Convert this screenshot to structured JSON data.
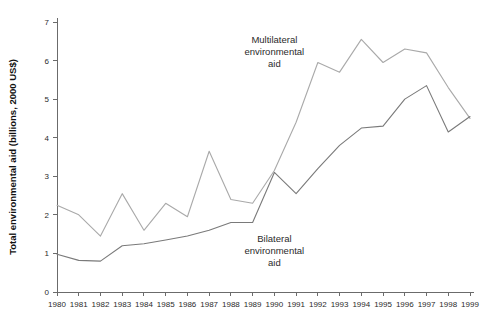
{
  "chart_data": {
    "type": "line",
    "title": "",
    "xlabel": "",
    "ylabel": "Total environmental aid (billions, 2000 US$)",
    "categories": [
      "1980",
      "1981",
      "1982",
      "1983",
      "1984",
      "1985",
      "1986",
      "1987",
      "1988",
      "1989",
      "1990",
      "1991",
      "1992",
      "1993",
      "1994",
      "1995",
      "1996",
      "1997",
      "1998",
      "1999"
    ],
    "x": [
      1980,
      1981,
      1982,
      1983,
      1984,
      1985,
      1986,
      1987,
      1988,
      1989,
      1990,
      1991,
      1992,
      1993,
      1994,
      1995,
      1996,
      1997,
      1998,
      1999
    ],
    "xlim": [
      1980,
      1999
    ],
    "ylim": [
      0,
      7
    ],
    "yticks": [
      0,
      1,
      2,
      3,
      4,
      5,
      6,
      7
    ],
    "grid": false,
    "legend": "annotations-inline",
    "series": [
      {
        "name": "Multilateral environmental aid",
        "color": "#a9a9a9",
        "values": [
          2.25,
          2.0,
          1.45,
          2.55,
          1.6,
          2.3,
          1.95,
          3.65,
          2.4,
          2.3,
          3.15,
          4.4,
          5.95,
          5.7,
          6.55,
          5.95,
          6.3,
          6.2,
          5.3,
          4.5
        ]
      },
      {
        "name": "Bilateral environmental aid",
        "color": "#7a7a7a",
        "values": [
          0.98,
          0.82,
          0.8,
          1.2,
          1.25,
          1.35,
          1.45,
          1.6,
          1.8,
          1.8,
          3.1,
          2.55,
          3.2,
          3.8,
          4.25,
          4.3,
          5.0,
          5.35,
          4.15,
          4.55
        ]
      }
    ],
    "annotations": [
      {
        "name": "multilateral-label",
        "lines": [
          "Multilateral",
          "environmental",
          "aid"
        ],
        "x": 1990.0,
        "y": 6.45
      },
      {
        "name": "bilateral-label",
        "lines": [
          "Bilateral",
          "environmental",
          "aid"
        ],
        "x": 1990.0,
        "y": 1.3
      }
    ]
  }
}
